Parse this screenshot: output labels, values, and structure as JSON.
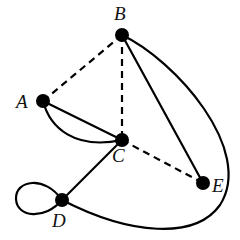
{
  "diagram": {
    "type": "graph",
    "colors": {
      "node": "#000000",
      "edge": "#000000",
      "background": "#ffffff"
    },
    "nodes": [
      {
        "id": "A",
        "label": "A",
        "x": 43,
        "y": 101,
        "label_x": 16,
        "label_y": 108
      },
      {
        "id": "B",
        "label": "B",
        "x": 122,
        "y": 35,
        "label_x": 114,
        "label_y": 20
      },
      {
        "id": "C",
        "label": "C",
        "x": 122,
        "y": 140,
        "label_x": 112,
        "label_y": 162
      },
      {
        "id": "D",
        "label": "D",
        "x": 62,
        "y": 200,
        "label_x": 52,
        "label_y": 227
      },
      {
        "id": "E",
        "label": "E",
        "x": 203,
        "y": 183,
        "label_x": 212,
        "label_y": 192
      }
    ],
    "edges": [
      {
        "from": "A",
        "to": "B",
        "style": "dashed"
      },
      {
        "from": "B",
        "to": "C",
        "style": "dashed"
      },
      {
        "from": "C",
        "to": "E",
        "style": "dashed"
      },
      {
        "from": "A",
        "to": "C",
        "style": "solid",
        "shape": "straight"
      },
      {
        "from": "A",
        "to": "C",
        "style": "solid",
        "shape": "curved"
      },
      {
        "from": "B",
        "to": "E",
        "style": "solid",
        "shape": "straight"
      },
      {
        "from": "B",
        "to": "D",
        "style": "solid",
        "shape": "curved"
      },
      {
        "from": "C",
        "to": "D",
        "style": "solid",
        "shape": "straight"
      },
      {
        "from": "D",
        "to": "D",
        "style": "solid",
        "shape": "loop"
      }
    ]
  }
}
